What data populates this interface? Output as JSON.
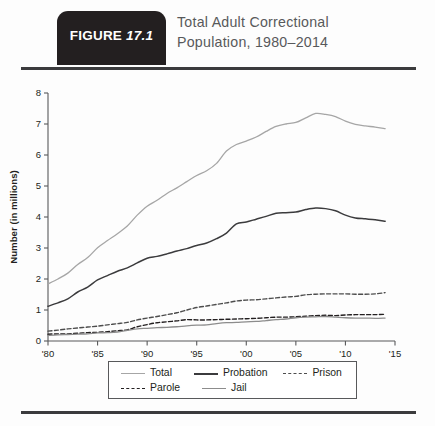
{
  "header": {
    "badge_word": "FIGURE",
    "badge_number": "17.1",
    "title_line1": "Total Adult Correctional",
    "title_line2": "Population, 1980–2014"
  },
  "legend": {
    "items": [
      {
        "label": "Total",
        "style": "solid",
        "color": "#a6a6a6"
      },
      {
        "label": "Probation",
        "style": "solid",
        "color": "#3b3b3d"
      },
      {
        "label": "Prison",
        "style": "dashed",
        "color": "#4d4d4d"
      },
      {
        "label": "Parole",
        "style": "dashed",
        "color": "#231f20"
      },
      {
        "label": "Jail",
        "style": "solid",
        "color": "#8c8c8c"
      }
    ]
  },
  "chart_data": {
    "type": "line",
    "title": "Total Adult Correctional Population, 1980–2014",
    "xlabel": "",
    "ylabel": "Number (in millions)",
    "xlim": [
      1980,
      2015
    ],
    "ylim": [
      0,
      8
    ],
    "grid": false,
    "legend_position": "bottom",
    "y_ticks": [
      0,
      1,
      2,
      3,
      4,
      5,
      6,
      7,
      8
    ],
    "y_tick_labels": [
      "0",
      "1",
      "2",
      "3",
      "4",
      "5",
      "6",
      "7",
      "8"
    ],
    "x_ticks": [
      1980,
      1985,
      1990,
      1995,
      2000,
      2005,
      2010,
      2015
    ],
    "x_tick_labels": [
      "'80",
      "'85",
      "'90",
      "'95",
      "'00",
      "'05",
      "'10",
      "'15"
    ],
    "x": [
      1980,
      1981,
      1982,
      1983,
      1984,
      1985,
      1986,
      1987,
      1988,
      1989,
      1990,
      1991,
      1992,
      1993,
      1994,
      1995,
      1996,
      1997,
      1998,
      1999,
      2000,
      2001,
      2002,
      2003,
      2004,
      2005,
      2006,
      2007,
      2008,
      2009,
      2010,
      2011,
      2012,
      2013,
      2014
    ],
    "series": [
      {
        "name": "Total",
        "style": "solid",
        "color": "#a6a6a6",
        "width": 1.3,
        "values": [
          1.84,
          2.0,
          2.19,
          2.47,
          2.69,
          3.01,
          3.24,
          3.46,
          3.71,
          4.06,
          4.35,
          4.54,
          4.76,
          4.94,
          5.14,
          5.34,
          5.49,
          5.73,
          6.13,
          6.34,
          6.45,
          6.58,
          6.76,
          6.92,
          7.0,
          7.05,
          7.2,
          7.34,
          7.31,
          7.24,
          7.09,
          6.99,
          6.94,
          6.9,
          6.85
        ]
      },
      {
        "name": "Probation",
        "style": "solid",
        "color": "#3b3b3d",
        "width": 1.5,
        "values": [
          1.12,
          1.23,
          1.36,
          1.58,
          1.74,
          1.97,
          2.11,
          2.25,
          2.36,
          2.52,
          2.67,
          2.73,
          2.81,
          2.9,
          2.98,
          3.08,
          3.16,
          3.3,
          3.48,
          3.78,
          3.84,
          3.93,
          4.02,
          4.12,
          4.14,
          4.16,
          4.24,
          4.29,
          4.27,
          4.2,
          4.06,
          3.97,
          3.94,
          3.91,
          3.86
        ]
      },
      {
        "name": "Prison",
        "style": "dashed",
        "color": "#4d4d4d",
        "width": 1.4,
        "values": [
          0.32,
          0.35,
          0.39,
          0.42,
          0.45,
          0.48,
          0.52,
          0.56,
          0.6,
          0.68,
          0.74,
          0.79,
          0.85,
          0.91,
          1.0,
          1.08,
          1.13,
          1.18,
          1.23,
          1.29,
          1.32,
          1.33,
          1.36,
          1.39,
          1.42,
          1.44,
          1.49,
          1.51,
          1.52,
          1.52,
          1.52,
          1.51,
          1.51,
          1.52,
          1.56
        ]
      },
      {
        "name": "Parole",
        "style": "dashed",
        "color": "#231f20",
        "width": 1.4,
        "values": [
          0.22,
          0.23,
          0.23,
          0.25,
          0.27,
          0.28,
          0.3,
          0.33,
          0.36,
          0.46,
          0.53,
          0.59,
          0.62,
          0.65,
          0.69,
          0.68,
          0.68,
          0.69,
          0.7,
          0.71,
          0.72,
          0.73,
          0.75,
          0.77,
          0.77,
          0.78,
          0.8,
          0.82,
          0.83,
          0.82,
          0.84,
          0.85,
          0.85,
          0.85,
          0.86
        ]
      },
      {
        "name": "Jail",
        "style": "solid",
        "color": "#8c8c8c",
        "width": 1.3,
        "values": [
          0.18,
          0.2,
          0.21,
          0.22,
          0.23,
          0.26,
          0.27,
          0.29,
          0.34,
          0.39,
          0.41,
          0.43,
          0.44,
          0.46,
          0.49,
          0.51,
          0.52,
          0.56,
          0.59,
          0.6,
          0.62,
          0.63,
          0.66,
          0.69,
          0.71,
          0.75,
          0.77,
          0.78,
          0.79,
          0.77,
          0.75,
          0.74,
          0.74,
          0.73,
          0.74
        ]
      }
    ]
  }
}
